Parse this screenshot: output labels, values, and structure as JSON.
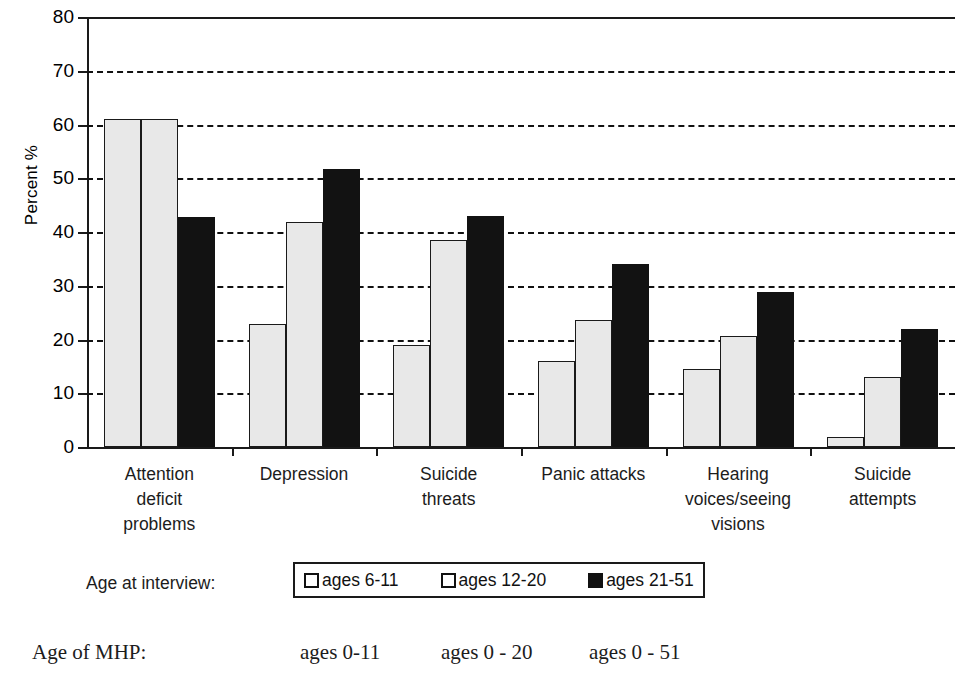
{
  "chart_data": {
    "type": "bar",
    "title": "",
    "xlabel": "",
    "ylabel": "Percent %",
    "ylim": [
      0,
      80
    ],
    "yticks": [
      "0",
      "10",
      "20",
      "30",
      "40",
      "50",
      "60",
      "70",
      "80"
    ],
    "grid": "horizontal dashed gridlines at 10,20,30,40,50,60,70",
    "legend_position": "below plot, boxed",
    "categories": [
      "Attention deficit problems",
      "Depression",
      "Suicide threats",
      "Panic attacks",
      "Hearing voices/seeing visions",
      "Suicide attempts"
    ],
    "category_lines": [
      [
        "Attention",
        "deficit",
        "problems"
      ],
      [
        "Depression"
      ],
      [
        "Suicide",
        "threats"
      ],
      [
        "Panic attacks"
      ],
      [
        "Hearing",
        "voices/seeing",
        "visions"
      ],
      [
        "Suicide",
        "attempts"
      ]
    ],
    "series": [
      {
        "name": "ages 6-11",
        "swatch": "light",
        "values": [
          61,
          22.8,
          19,
          16,
          14.6,
          1.8
        ]
      },
      {
        "name": "ages 12-20",
        "swatch": "light",
        "values": [
          61,
          41.8,
          38.6,
          23.7,
          20.6,
          13
        ]
      },
      {
        "name": "ages 21-51",
        "swatch": "dark",
        "values": [
          42.8,
          51.8,
          43,
          34,
          28.8,
          22
        ]
      }
    ]
  },
  "legend": {
    "caption": "Age at interview:",
    "entries": [
      {
        "label": "ages 6-11",
        "swatch": "light"
      },
      {
        "label": "ages 12-20",
        "swatch": "light"
      },
      {
        "label": "ages 21-51",
        "swatch": "dark"
      }
    ]
  },
  "mhp_row": {
    "caption": "Age of MHP:",
    "values": [
      "ages  0-11",
      "ages  0 - 20",
      "ages  0 - 51"
    ]
  },
  "colors": {
    "light_bar": "#e8e8e8",
    "dark_bar": "#121212",
    "axis": "#1a1a1a",
    "text": "#1c1c1c",
    "background": "#ffffff"
  }
}
